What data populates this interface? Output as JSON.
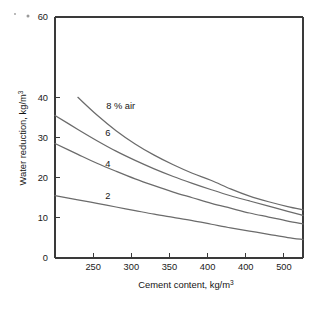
{
  "chart_data": {
    "type": "line",
    "title": "",
    "xlabel": "Cement content, kg/m3",
    "xlabel_base": "Cement content, kg/m",
    "xlabel_sup": "3",
    "ylabel": "Water reduction, kg/m3",
    "ylabel_base": "Water reduction, kg/m",
    "ylabel_sup": "3",
    "xlim": [
      220,
      545
    ],
    "ylim": [
      0,
      60
    ],
    "xticks": [
      250,
      300,
      350,
      400,
      400,
      500
    ],
    "xtick_labels": [
      "250",
      "300",
      "350",
      "400",
      "400",
      "500"
    ],
    "yticks": [
      0,
      10,
      20,
      30,
      40,
      60
    ],
    "ytick_labels": [
      "0",
      "10",
      "20",
      "30",
      "40",
      "60"
    ],
    "grid": false,
    "legend_position": "inline-annotations",
    "x": [
      220,
      250,
      275,
      300,
      325,
      350,
      375,
      400,
      425,
      450,
      475,
      500,
      525,
      545
    ],
    "series": [
      {
        "name": "8 % air",
        "label": "8 % air",
        "label_x": 287,
        "label_y": 37.2,
        "x_start": 238,
        "values": [
          null,
          40.0,
          35.6,
          31.7,
          28.4,
          25.6,
          23.2,
          21.1,
          19.3,
          17.2,
          15.4,
          14.0,
          12.8,
          12.0
        ]
      },
      {
        "name": "6",
        "label": "6",
        "label_x": 286,
        "label_y": 30.3,
        "x_start": 220,
        "values": [
          35.5,
          32.0,
          29.2,
          26.6,
          24.3,
          22.2,
          20.3,
          18.6,
          17.0,
          15.5,
          14.2,
          12.9,
          11.6,
          10.6
        ]
      },
      {
        "name": "4",
        "label": "4",
        "label_x": 286,
        "label_y": 22.7,
        "x_start": 220,
        "values": [
          28.5,
          25.8,
          23.6,
          21.6,
          19.7,
          18.0,
          16.4,
          15.0,
          13.6,
          12.4,
          11.2,
          10.2,
          9.2,
          8.5
        ]
      },
      {
        "name": "2",
        "label": "2",
        "label_x": 286,
        "label_y": 14.6,
        "x_start": 220,
        "values": [
          15.5,
          14.5,
          13.6,
          12.7,
          11.8,
          10.9,
          10.1,
          9.3,
          8.4,
          7.5,
          6.7,
          5.9,
          5.1,
          4.6
        ]
      }
    ]
  }
}
